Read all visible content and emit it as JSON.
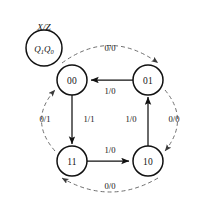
{
  "diagram": {
    "type": "state-transition-diagram",
    "legend": {
      "title": "X/Z",
      "state_var": "Q",
      "state_var_sub1": "1",
      "state_var_sub0": "0",
      "state_label": "Q1Q0"
    },
    "states": [
      {
        "id": "s00",
        "label": "00",
        "x": 72,
        "y": 80
      },
      {
        "id": "s01",
        "label": "01",
        "x": 148,
        "y": 80
      },
      {
        "id": "s11",
        "label": "11",
        "x": 72,
        "y": 161
      },
      {
        "id": "s10",
        "label": "10",
        "x": 148,
        "y": 161
      }
    ],
    "transitions": [
      {
        "from": "s00",
        "to": "s01",
        "label": "0/0",
        "style": "dashed",
        "label_x": 110,
        "label_y": 48
      },
      {
        "from": "s01",
        "to": "s00",
        "label": "1/0",
        "style": "solid",
        "label_x": 110,
        "label_y": 90
      },
      {
        "from": "s01",
        "to": "s10",
        "label": "0/0",
        "style": "dashed",
        "label_x": 173,
        "label_y": 119
      },
      {
        "from": "s10",
        "to": "s01",
        "label": "1/0",
        "style": "solid",
        "label_x": 130,
        "label_y": 119
      },
      {
        "from": "s10",
        "to": "s11",
        "label": "0/0",
        "style": "dashed",
        "label_x": 110,
        "label_y": 185
      },
      {
        "from": "s11",
        "to": "s10",
        "label": "1/0",
        "style": "solid",
        "label_x": 110,
        "label_y": 150
      },
      {
        "from": "s11",
        "to": "s00",
        "label": "1/1",
        "style": "solid",
        "label_x": 89,
        "label_y": 119
      },
      {
        "from": "s00",
        "to": "s11",
        "label": "0/1",
        "style": "dashed",
        "label_x": 46,
        "label_y": 119
      }
    ],
    "colors": {
      "stroke": "#111111",
      "dashed_stroke": "#6f6f6f",
      "background": "#ffffff"
    }
  }
}
